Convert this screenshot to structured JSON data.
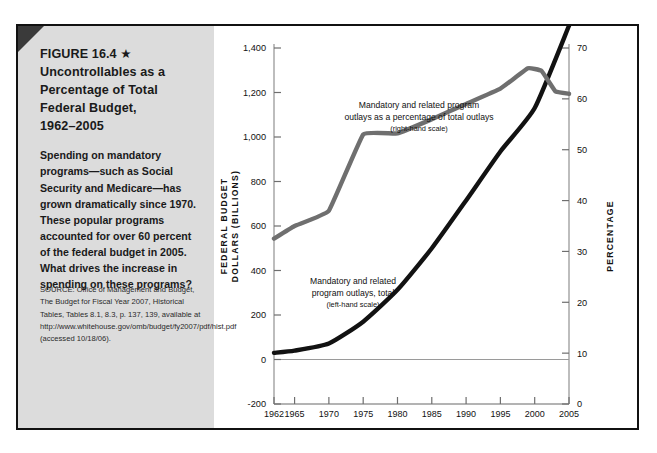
{
  "figure": {
    "label": "FIGURE 16.4 ★",
    "title_lines": [
      "Uncontrollables as a",
      "Percentage of Total",
      "Federal Budget,",
      "1962–2005"
    ],
    "body": "Spending on mandatory programs—such as Social Security and Medicare—has grown dramatically since 1970. These popular programs accounted for over 60 percent of the federal budget in 2005. What drives the increase in spending on these programs?",
    "source": "SOURCE: Office of Management and Budget, The Budget for Fiscal Year 2007, Historical Tables, Tables 8.1, 8.3, p. 137, 139, available at http://www.whitehouse.gov/omb/budget/fy2007/pdf/hist.pdf (accessed 10/18/06)."
  },
  "chart_data": {
    "type": "line",
    "xlabel": "",
    "ylabel": "FEDERAL BUDGET DOLLARS (BILLIONS)",
    "y2label": "PERCENTAGE",
    "xlim": [
      1962,
      2005
    ],
    "ylim": [
      -200,
      1400
    ],
    "y2lim": [
      0,
      70
    ],
    "yticks": [
      -200,
      0,
      200,
      400,
      600,
      800,
      1000,
      1200,
      1400
    ],
    "yticklabels": [
      "-200",
      "0",
      "200",
      "400",
      "600",
      "800",
      "1,000",
      "1,200",
      "1,400"
    ],
    "y2ticks": [
      0,
      10,
      20,
      30,
      40,
      50,
      60,
      70
    ],
    "y2ticklabels": [
      "0",
      "10",
      "20",
      "30",
      "40",
      "50",
      "60",
      "70"
    ],
    "xticks": [
      1962,
      1965,
      1970,
      1975,
      1980,
      1985,
      1990,
      1995,
      2000,
      2005
    ],
    "xticklabels": [
      "1962",
      "1965",
      "1970",
      "1975",
      "1980",
      "1985",
      "1990",
      "1995",
      "2000",
      "2005"
    ],
    "grid": false,
    "legend": "annotations",
    "series": [
      {
        "name": "Mandatory and related program outlays, total",
        "scale": "left",
        "unit": "billions of dollars",
        "color": "#121212",
        "x": [
          1962,
          1965,
          1970,
          1975,
          1980,
          1985,
          1990,
          1995,
          2000,
          2005
        ],
        "values": [
          30,
          40,
          72,
          170,
          313,
          500,
          715,
          935,
          1130,
          1500
        ]
      },
      {
        "name": "Mandatory and related program outlays as a percentage of total outlays",
        "scale": "right",
        "unit": "percent",
        "color": "#6f6f6f",
        "x": [
          1962,
          1965,
          1970,
          1975,
          1980,
          1985,
          1990,
          1995,
          1999,
          2001,
          2003,
          2005
        ],
        "values": [
          32.5,
          35.0,
          38.0,
          53.0,
          53.2,
          56.0,
          59.0,
          62.0,
          66.0,
          65.5,
          61.5,
          61.0
        ]
      }
    ],
    "annotations": [
      {
        "name": "gray-series-annotation",
        "line1": "Mandatory and related program",
        "line2": "outlays as a percentage of total outlays",
        "line3": "(right-hand scale)"
      },
      {
        "name": "black-series-annotation",
        "line1": "Mandatory and related",
        "line2": "program outlays, total",
        "line3": "(left-hand scale)"
      }
    ]
  }
}
